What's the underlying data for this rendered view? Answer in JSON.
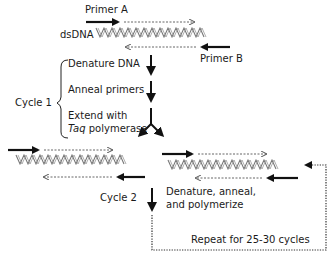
{
  "top": {
    "primer_a": "Primer A",
    "primer_b": "Primer B",
    "dsdna": "dsDNA"
  },
  "cycle1": {
    "label": "Cycle 1",
    "steps": [
      {
        "label": "Denature DNA"
      },
      {
        "label": "Anneal primers"
      },
      {
        "label_line1": "Extend with",
        "label_italic": "Taq",
        "label_rest": " polymerase"
      }
    ]
  },
  "cycle2": {
    "label": "Cycle 2",
    "step_line1": "Denature, anneal,",
    "step_line2": "and polymerize"
  },
  "repeat": {
    "label": "Repeat for 25-30 cycles"
  },
  "colors": {
    "arrow": "#111111",
    "helix": "#777777",
    "dotted": "#555555"
  }
}
